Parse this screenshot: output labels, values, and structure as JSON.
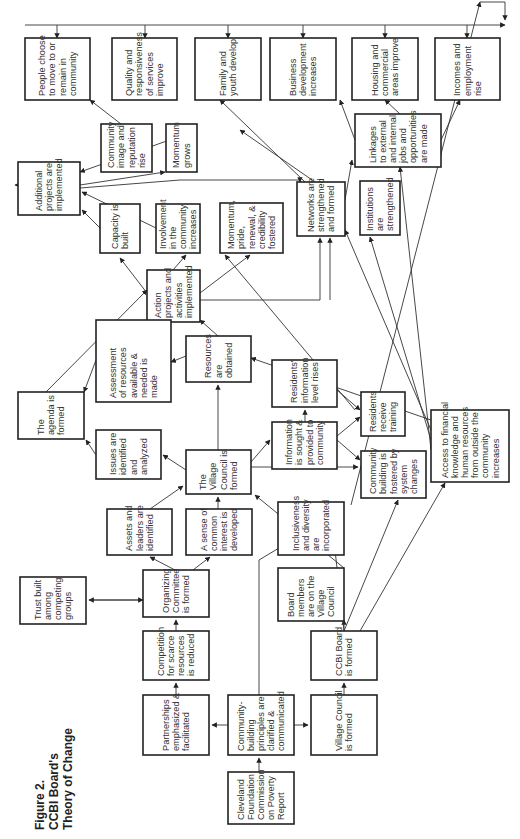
{
  "figure": {
    "label": "Figure 2.",
    "title_line1": "CCBI Board's",
    "title_line2": "Theory of Change"
  },
  "nodes": [
    {
      "id": "people",
      "x": 25,
      "y": 38,
      "w": 65,
      "h": 62,
      "lines": [
        "People choose",
        "to move to or",
        "remain in",
        "community"
      ]
    },
    {
      "id": "quality",
      "x": 112,
      "y": 38,
      "w": 65,
      "h": 62,
      "lines": [
        "Quality and",
        "responsiveness",
        "of services",
        "improve"
      ]
    },
    {
      "id": "family",
      "x": 195,
      "y": 38,
      "w": 66,
      "h": 62,
      "lines": [
        "Family and",
        "youth develop"
      ]
    },
    {
      "id": "business",
      "x": 270,
      "y": 38,
      "w": 66,
      "h": 62,
      "lines": [
        "Business",
        "development",
        "increases"
      ]
    },
    {
      "id": "housing",
      "x": 352,
      "y": 38,
      "w": 66,
      "h": 62,
      "lines": [
        "Housing and",
        "commercial",
        "areas improve"
      ]
    },
    {
      "id": "incomes",
      "x": 435,
      "y": 38,
      "w": 65,
      "h": 62,
      "lines": [
        "Incomes and",
        "employment",
        "rise"
      ]
    },
    {
      "id": "image",
      "x": 101,
      "y": 124,
      "w": 51,
      "h": 48,
      "lines": [
        "Community",
        "image and",
        "reputation",
        "rise"
      ]
    },
    {
      "id": "momentum",
      "x": 166,
      "y": 124,
      "w": 31,
      "h": 48,
      "lines": [
        "Momentum",
        "grows"
      ]
    },
    {
      "id": "additional",
      "x": 18,
      "y": 162,
      "w": 62,
      "h": 53,
      "lines": [
        "Additional",
        "projects are",
        "implemented"
      ]
    },
    {
      "id": "linkages",
      "x": 355,
      "y": 114,
      "w": 86,
      "h": 53,
      "lines": [
        "Linkages",
        "to external",
        "and internal",
        "jobs and",
        "opportunities",
        "are made"
      ]
    },
    {
      "id": "capacity",
      "x": 100,
      "y": 204,
      "w": 40,
      "h": 49,
      "lines": [
        "Capacity is",
        "built"
      ]
    },
    {
      "id": "involvement",
      "x": 156,
      "y": 204,
      "w": 44,
      "h": 49,
      "lines": [
        "Involvement",
        "in the",
        "community",
        "increases"
      ]
    },
    {
      "id": "pride",
      "x": 220,
      "y": 203,
      "w": 63,
      "h": 50,
      "lines": [
        "Momentum,",
        "pride,",
        "renewal, &",
        "credibility",
        "fostered"
      ]
    },
    {
      "id": "networks",
      "x": 297,
      "y": 182,
      "w": 48,
      "h": 54,
      "lines": [
        "Networks are",
        "strengthened",
        "and formed"
      ]
    },
    {
      "id": "institutions",
      "x": 360,
      "y": 181,
      "w": 40,
      "h": 54,
      "lines": [
        "Institutions",
        "are",
        "strengthened"
      ]
    },
    {
      "id": "action",
      "x": 147,
      "y": 270,
      "w": 53,
      "h": 52,
      "lines": [
        "Action",
        "projects and",
        "activities",
        "implemented"
      ]
    },
    {
      "id": "agenda",
      "x": 18,
      "y": 392,
      "w": 66,
      "h": 47,
      "lines": [
        "The",
        "agenda is",
        "formed"
      ]
    },
    {
      "id": "assessment",
      "x": 96,
      "y": 320,
      "w": 75,
      "h": 82,
      "lines": [
        "Assessment",
        "of resources",
        "available &",
        "needed is",
        "made"
      ]
    },
    {
      "id": "resources",
      "x": 186,
      "y": 336,
      "w": 65,
      "h": 46,
      "lines": [
        "Resources",
        "are",
        "obtained"
      ]
    },
    {
      "id": "residents_info",
      "x": 272,
      "y": 360,
      "w": 65,
      "h": 47,
      "lines": [
        "Residents'",
        "information",
        "level rises"
      ]
    },
    {
      "id": "training",
      "x": 361,
      "y": 392,
      "w": 44,
      "h": 44,
      "lines": [
        "Residents",
        "receive",
        "training"
      ]
    },
    {
      "id": "access",
      "x": 431,
      "y": 410,
      "w": 78,
      "h": 72,
      "lines": [
        "Access to financial",
        "knowledge and",
        "human resources",
        "from outside the",
        "community",
        "increases"
      ]
    },
    {
      "id": "issues",
      "x": 96,
      "y": 430,
      "w": 65,
      "h": 49,
      "lines": [
        "Issues are",
        "identified",
        "and",
        "analyzed"
      ]
    },
    {
      "id": "village",
      "x": 186,
      "y": 450,
      "w": 65,
      "h": 44,
      "lines": [
        "The",
        "Village",
        "Council is",
        "formed"
      ]
    },
    {
      "id": "information",
      "x": 272,
      "y": 422,
      "w": 65,
      "h": 47,
      "lines": [
        "Information",
        "is sought &",
        "provided to",
        "community"
      ]
    },
    {
      "id": "community_building",
      "x": 361,
      "y": 451,
      "w": 65,
      "h": 47,
      "lines": [
        "Community",
        "building is",
        "fostered by",
        "system",
        "changes"
      ]
    },
    {
      "id": "assets",
      "x": 107,
      "y": 509,
      "w": 65,
      "h": 46,
      "lines": [
        "Assets and",
        "leaders are",
        "identified"
      ]
    },
    {
      "id": "sense",
      "x": 186,
      "y": 509,
      "w": 66,
      "h": 46,
      "lines": [
        "A sense of",
        "common",
        "interest is",
        "developed"
      ]
    },
    {
      "id": "inclusiveness",
      "x": 278,
      "y": 502,
      "w": 66,
      "h": 53,
      "lines": [
        "Inclusiveness",
        "and diversity",
        "are",
        "incorporated"
      ]
    },
    {
      "id": "trust",
      "x": 20,
      "y": 577,
      "w": 66,
      "h": 47,
      "lines": [
        "Trust built",
        "among",
        "competing",
        "groups"
      ]
    },
    {
      "id": "organizing",
      "x": 143,
      "y": 570,
      "w": 66,
      "h": 47,
      "lines": [
        "Organizing",
        "Committee",
        "is formed"
      ]
    },
    {
      "id": "board_members",
      "x": 278,
      "y": 568,
      "w": 66,
      "h": 53,
      "lines": [
        "Board",
        "members",
        "are on the",
        "Village",
        "Council"
      ]
    },
    {
      "id": "competition",
      "x": 143,
      "y": 631,
      "w": 66,
      "h": 49,
      "lines": [
        "Competition",
        "for scarce",
        "resources",
        "is reduced"
      ]
    },
    {
      "id": "ccbi_board",
      "x": 311,
      "y": 631,
      "w": 66,
      "h": 49,
      "lines": [
        "CCBI Board",
        "is formed"
      ]
    },
    {
      "id": "partnerships",
      "x": 143,
      "y": 695,
      "w": 66,
      "h": 60,
      "lines": [
        "Partnerships",
        "emphasized &",
        "facilitated"
      ]
    },
    {
      "id": "principles",
      "x": 228,
      "y": 695,
      "w": 66,
      "h": 60,
      "lines": [
        "Community-",
        "building",
        "principles are",
        "clarified &",
        "communicated"
      ]
    },
    {
      "id": "village_formed",
      "x": 311,
      "y": 695,
      "w": 66,
      "h": 60,
      "lines": [
        "Village Council",
        "is formed"
      ]
    },
    {
      "id": "cleveland",
      "x": 228,
      "y": 772,
      "w": 66,
      "h": 52,
      "lines": [
        "Cleveland",
        "Foundation",
        "Commission",
        "on Poverty",
        "Report"
      ]
    }
  ],
  "edges": [
    "M259,772 L259,758",
    "M228,725 L212,725",
    "M294,725 L308,725",
    "M176,695 L176,683",
    "M176,631 L176,620",
    "M344,695 L344,683",
    "M143,600 L89,600",
    "M89,600 L143,600",
    "M175,570 L150,557",
    "M193,570 L210,557",
    "M150,509 L183,486",
    "M218,509 L218,497",
    "M259,695 L259,620 L259,560 L284,545",
    "M186,470 L163,455",
    "M218,450 L218,385",
    "M251,467 L358,467",
    "M251,462 L270,440",
    "M305,422 L305,410",
    "M337,436 L360,417",
    "M337,390 L360,410",
    "M337,440 L360,460",
    "M96,455 L86,440",
    "M186,356 L171,362",
    "M96,360 L84,392",
    "M46,392 L147,290",
    "M171,320 L173,320",
    "M218,336 L200,320",
    "M147,293 L120,258",
    "M173,270 L186,255",
    "M200,293 L250,255",
    "M200,300 L320,300 L320,238",
    "M330,300 L330,238",
    "M18,185 L15,185",
    "M100,228 L82,210",
    "M156,228 L82,192",
    "M80,188 L180,180 L300,180 L300,182",
    "M80,185 L165,172",
    "M152,148 L90,100",
    "M175,138 L80,172",
    "M305,182 L220,100",
    "M345,200 L352,160",
    "M315,182 L240,130",
    "M355,140 L340,100",
    "M400,114 L385,100",
    "M441,140 L460,100",
    "M431,420 L251,358",
    "M431,430 L345,230",
    "M431,440 L370,237",
    "M431,450 L400,167",
    "M344,631 L344,620",
    "M360,631 L445,483",
    "M344,631 L398,500",
    "M344,631 L330,505",
    "M351,505 L480,2",
    "M355,410 L225,255",
    "M344,568 L255,495",
    "M480,2 L505,2 L505,20",
    "M25,25 L505,25",
    "M57,25 L57,38",
    "M145,25 L145,38",
    "M228,25 L228,38",
    "M303,25 L303,38",
    "M385,25 L385,38",
    "M467,25 L467,38"
  ]
}
